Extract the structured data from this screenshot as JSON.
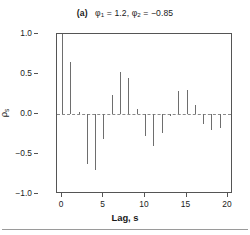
{
  "figure": {
    "panel_label": "(a)",
    "title_text": "(a)  φ₁ = 1.2, φ₂ = −0.85",
    "bottom_rule": "horizontal-rule"
  },
  "chart_data": {
    "type": "bar",
    "subtitle": "",
    "xlabel": "Lag, s",
    "ylabel": "ρₛ",
    "xlim": [
      -0.6,
      20.6
    ],
    "ylim": [
      -1.0,
      1.0
    ],
    "xticks": [
      0,
      5,
      10,
      15,
      20
    ],
    "xtick_labels": [
      "0",
      "5",
      "10",
      "15",
      "20"
    ],
    "yticks": [
      1.0,
      0.5,
      0.0,
      -0.5,
      -1.0
    ],
    "ytick_labels": [
      "1.0",
      "0.5",
      "0.0",
      "-0.5",
      "-1.0"
    ],
    "grid": false,
    "legend": "none",
    "annotations": [
      "dashed horizontal reference line at rho = 0"
    ],
    "model": {
      "process": "AR(2)",
      "phi_1": 1.2,
      "phi_2": -0.85
    },
    "categories": [
      0,
      1,
      2,
      3,
      4,
      5,
      6,
      7,
      8,
      9,
      10,
      11,
      12,
      13,
      14,
      15,
      16,
      17,
      18,
      19,
      20
    ],
    "values": [
      1.0,
      0.65,
      0.03,
      -0.63,
      -0.7,
      -0.31,
      0.24,
      0.53,
      0.45,
      0.06,
      -0.28,
      -0.4,
      -0.24,
      -0.02,
      0.29,
      0.3,
      0.11,
      -0.12,
      -0.2,
      -0.17,
      0.0
    ]
  },
  "axes": {
    "y_label": "ρₛ",
    "x_label": "Lag, s"
  }
}
